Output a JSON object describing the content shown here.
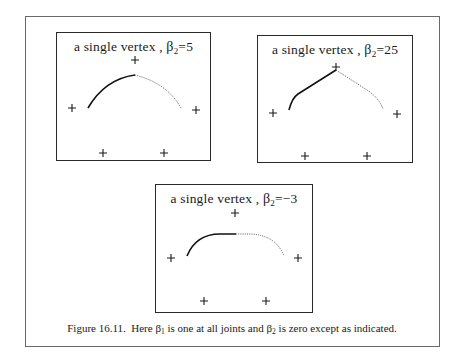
{
  "figure": {
    "caption": {
      "label": "Figure 16.11.",
      "text_1": "Here ",
      "beta1_symbol": "β",
      "beta1_sub": "1",
      "text_2": " is one at all joints and ",
      "beta2_symbol": "β",
      "beta2_sub": "2",
      "text_3": " is zero except as indicated."
    },
    "panels": [
      {
        "title_prefix": "a single vertex , ",
        "beta_symbol": "β",
        "beta_sub": "2",
        "beta_value": "=5",
        "control_points": [
          [
            15,
            75
          ],
          [
            46,
            120
          ],
          [
            78,
            27
          ],
          [
            107,
            120
          ],
          [
            139,
            77
          ]
        ],
        "curve_solid": "M31,75 Q48,46 78,42",
        "curve_dotted": "M78,42 Q110,50 124,75"
      },
      {
        "title_prefix": "a single vertex , ",
        "beta_symbol": "β",
        "beta_sub": "2",
        "beta_value": "=25",
        "control_points": [
          [
            15,
            77
          ],
          [
            47,
            120
          ],
          [
            78,
            31
          ],
          [
            109,
            120
          ],
          [
            139,
            78
          ]
        ],
        "curve_solid": "M31,74 Q34,62 40,58 L78,34",
        "curve_dotted": "M78,34 L112,56 Q122,64 125,73"
      },
      {
        "title_prefix": "a single vertex , ",
        "beta_symbol": "β",
        "beta_sub": "2",
        "beta_value": "=−3",
        "control_points": [
          [
            15,
            73
          ],
          [
            48,
            116
          ],
          [
            79,
            28
          ],
          [
            110,
            116
          ],
          [
            142,
            73
          ]
        ],
        "curve_solid": "M31,71 Q40,49 64,49 L80,49",
        "curve_dotted": "M80,49 L94,49 Q120,50 128,71"
      }
    ]
  }
}
